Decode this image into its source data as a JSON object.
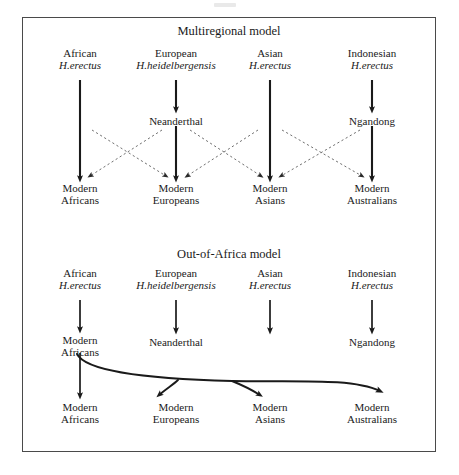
{
  "figure": {
    "panels": [
      {
        "id": "multiregional",
        "title": "Multiregional model",
        "title_x": 229,
        "title_y": 30,
        "ancestors": [
          {
            "region": "African",
            "species": "H.erectus",
            "x": 80,
            "y": 52
          },
          {
            "region": "European",
            "species": "H.heidelbergensis",
            "x": 176,
            "y": 52
          },
          {
            "region": "Asian",
            "species": "H.erectus",
            "x": 270,
            "y": 52
          },
          {
            "region": "Indonesian",
            "species": "H.erectus",
            "x": 372,
            "y": 52
          }
        ],
        "intermediates": [
          {
            "label": "Neanderthal",
            "x": 176,
            "y": 117
          },
          {
            "label": "Ngandong",
            "x": 372,
            "y": 117
          }
        ],
        "descendants": [
          {
            "line1": "Modern",
            "line2": "Africans",
            "x": 80,
            "y": 184
          },
          {
            "line1": "Modern",
            "line2": "Europeans",
            "x": 176,
            "y": 184
          },
          {
            "line1": "Modern",
            "line2": "Asians",
            "x": 270,
            "y": 184
          },
          {
            "line1": "Modern",
            "line2": "Australians",
            "x": 372,
            "y": 184
          }
        ],
        "solid_arrows": [
          {
            "from": "African H.erectus",
            "to": "Modern Africans",
            "x": 80,
            "y1": 80,
            "y2": 179
          },
          {
            "from": "European H.heidelbergensis",
            "to": "Neanderthal",
            "x": 176,
            "y1": 80,
            "y2": 110
          },
          {
            "from": "Neanderthal",
            "to": "Modern Europeans",
            "x": 176,
            "y1": 124,
            "y2": 179
          },
          {
            "from": "Asian H.erectus",
            "to": "Modern Asians",
            "x": 270,
            "y1": 80,
            "y2": 179
          },
          {
            "from": "Indonesian H.erectus",
            "to": "Ngandong",
            "x": 372,
            "y1": 80,
            "y2": 110
          },
          {
            "from": "Ngandong",
            "to": "Modern Australians",
            "x": 372,
            "y1": 124,
            "y2": 179
          }
        ],
        "gene_flow_arrows": [
          {
            "from": "African",
            "to": "Modern Europeans",
            "x1": 92,
            "y1": 130,
            "x2": 166,
            "y2": 177
          },
          {
            "from": "Neanderthal",
            "to": "Modern Africans",
            "x1": 162,
            "y1": 130,
            "x2": 90,
            "y2": 177
          },
          {
            "from": "Neanderthal",
            "to": "Modern Asians",
            "x1": 190,
            "y1": 130,
            "x2": 261,
            "y2": 177
          },
          {
            "from": "Asian",
            "to": "Modern Europeans",
            "x1": 258,
            "y1": 130,
            "x2": 187,
            "y2": 177
          },
          {
            "from": "Asian",
            "to": "Modern Australians",
            "x1": 282,
            "y1": 130,
            "x2": 362,
            "y2": 177
          },
          {
            "from": "Ngandong",
            "to": "Modern Asians",
            "x1": 360,
            "y1": 130,
            "x2": 280,
            "y2": 177
          }
        ]
      },
      {
        "id": "out-of-africa",
        "title": "Out-of-Africa model",
        "title_x": 229,
        "title_y": 253,
        "ancestors": [
          {
            "region": "African",
            "species": "H.erectus",
            "x": 80,
            "y": 272
          },
          {
            "region": "European",
            "species": "H.heidelbergensis",
            "x": 176,
            "y": 272
          },
          {
            "region": "Asian",
            "species": "H.erectus",
            "x": 270,
            "y": 272
          },
          {
            "region": "Indonesian",
            "species": "H.erectus",
            "x": 372,
            "y": 272
          }
        ],
        "intermediates": [
          {
            "line1": "Modern",
            "line2": "Africans",
            "x": 80,
            "y": 336
          },
          {
            "label": "Neanderthal",
            "x": 176,
            "y": 338
          },
          {
            "label": "Ngandong",
            "x": 372,
            "y": 338
          }
        ],
        "descendants": [
          {
            "line1": "Modern",
            "line2": "Africans",
            "x": 80,
            "y": 404
          },
          {
            "line1": "Modern",
            "line2": "Europeans",
            "x": 176,
            "y": 404
          },
          {
            "line1": "Modern",
            "line2": "Asians",
            "x": 270,
            "y": 404
          },
          {
            "line1": "Modern",
            "line2": "Australians",
            "x": 372,
            "y": 404
          }
        ],
        "solid_arrows": [
          {
            "from": "African H.erectus",
            "to": "Modern Africans",
            "x": 80,
            "y1": 300,
            "y2": 330
          },
          {
            "from": "European H.heidelbergensis",
            "to": "Neanderthal",
            "x": 176,
            "y1": 300,
            "y2": 331
          },
          {
            "from": "Asian H.erectus",
            "to": "extinction",
            "x": 270,
            "y1": 300,
            "y2": 331
          },
          {
            "from": "Indonesian H.erectus",
            "to": "Ngandong",
            "x": 372,
            "y1": 300,
            "y2": 331
          },
          {
            "from": "Modern Africans",
            "to": "Modern Africans",
            "x": 80,
            "y1": 352,
            "y2": 396
          }
        ],
        "migration_label": "out-of-africa dispersal",
        "migration_branches": [
          {
            "to": "Modern Europeans"
          },
          {
            "to": "Modern Asians"
          },
          {
            "to": "Modern Australians"
          }
        ]
      }
    ]
  },
  "style": {
    "ink": "#1a1a1a",
    "frame": "#4a4a4a",
    "dotted": "#707070"
  }
}
